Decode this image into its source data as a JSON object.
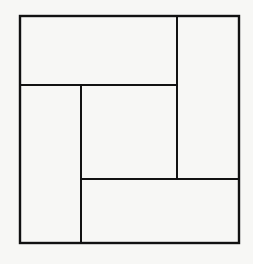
{
  "diagram": {
    "title": "",
    "background": "#f7f7f5",
    "stroke_color": "#111111",
    "outer_square": {
      "x": 20,
      "y": 16,
      "w": 219,
      "h": 227
    },
    "pieces": [
      {
        "name": "top-rectangle",
        "x": 20,
        "y": 16,
        "w": 157,
        "h": 69
      },
      {
        "name": "right-rectangle",
        "x": 177,
        "y": 16,
        "w": 62,
        "h": 163
      },
      {
        "name": "left-rectangle",
        "x": 20,
        "y": 85,
        "w": 61,
        "h": 158
      },
      {
        "name": "center-square",
        "x": 81,
        "y": 85,
        "w": 96,
        "h": 94
      },
      {
        "name": "bottom-rectangle",
        "x": 81,
        "y": 179,
        "w": 158,
        "h": 64
      }
    ]
  }
}
